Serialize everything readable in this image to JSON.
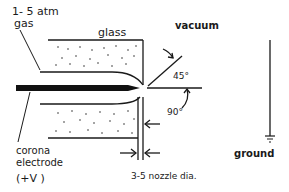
{
  "diagram": {
    "labels": {
      "gas_pressure": "1- 5  atm",
      "gas": "gas",
      "glass": "glass",
      "vacuum": "vacuum",
      "angle_45": "45°",
      "angle_90": "90°",
      "corona": "corona",
      "electrode": "electrode",
      "voltage": "(+V   )",
      "ground": "ground",
      "nozzle_dia": "3-5 nozzle dia."
    },
    "colors": {
      "ink": "#1a1a1a",
      "background": "#ffffff"
    }
  }
}
